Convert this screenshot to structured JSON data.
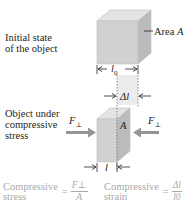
{
  "diagram": {
    "initial_state": {
      "label_line1": "Initial state",
      "label_line2": "of the object",
      "area_label": "Area ",
      "area_symbol": "A",
      "length_symbol": "l",
      "length_subscript": "0"
    },
    "delta": {
      "symbol": "Δl"
    },
    "compressed_state": {
      "label_line1": "Object under",
      "label_line2": "compressive",
      "label_line3": "stress",
      "force_left": "F",
      "force_left_sub": "⊥",
      "force_right": "F",
      "force_right_sub": "⊥",
      "area_symbol": "A",
      "length_symbol": "l"
    },
    "formulas": {
      "stress": {
        "name_line1": "Compressive",
        "name_line2": "stress",
        "equals": "=",
        "numerator": "F⊥",
        "denominator": "A"
      },
      "strain": {
        "name_line1": "Compressive",
        "name_line2": "strain",
        "equals": "=",
        "numerator": "Δl",
        "denominator": "l0"
      }
    },
    "colors": {
      "cube_front": "#cfd1d2",
      "cube_top": "#e3e4e5",
      "cube_side": "#b9bbbd",
      "arrow": "#939598",
      "formula_text": "#a7a9ac",
      "delta_region": "#ececec"
    }
  }
}
